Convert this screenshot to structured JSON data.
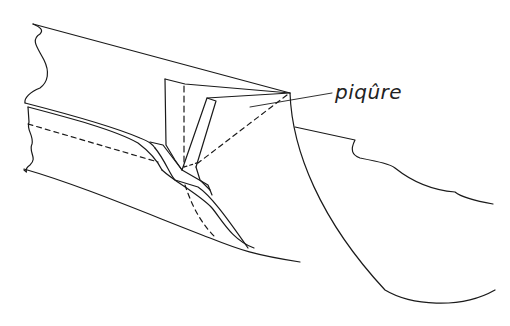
{
  "diagram": {
    "type": "sewing-technique-illustration",
    "labels": [
      {
        "id": "stitch-label",
        "text": "piqûre",
        "x": 337,
        "y": 78
      }
    ],
    "colors": {
      "line": "#1a1a1a",
      "background": "#ffffff"
    }
  }
}
